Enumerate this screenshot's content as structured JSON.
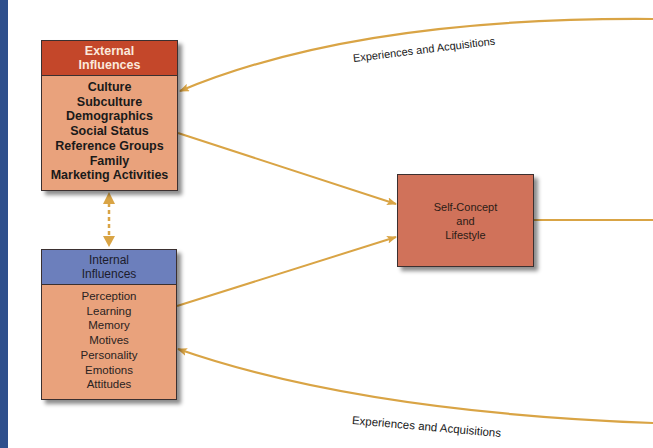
{
  "diagram": {
    "external": {
      "title_line1": "External",
      "title_line2": "Influences",
      "items": [
        "Culture",
        "Subculture",
        "Demographics",
        "Social Status",
        "Reference Groups",
        "Family",
        "Marketing Activities"
      ]
    },
    "internal": {
      "title_line1": "Internal",
      "title_line2": "Influences",
      "items": [
        "Perception",
        "Learning",
        "Memory",
        "Motives",
        "Personality",
        "Emotions",
        "Attitudes"
      ]
    },
    "center": {
      "line1": "Self-Concept",
      "line2": "and",
      "line3": "Lifestyle"
    },
    "labels": {
      "top_curve": "Experiences and Acquisitions",
      "bottom_curve": "Experiences and Acquisitions"
    },
    "colors": {
      "external_header": "#c4472a",
      "internal_header": "#6c7fbc",
      "box_body": "#e9a27c",
      "center_box": "#d0725a",
      "arrow": "#d9a445",
      "left_bar": "#2e4f8c"
    }
  }
}
